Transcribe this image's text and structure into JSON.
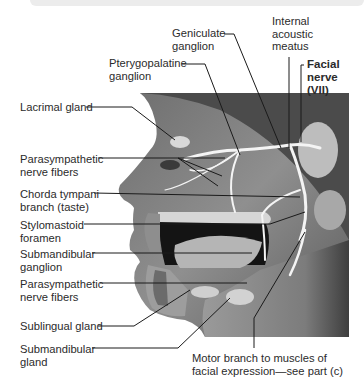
{
  "figure": {
    "title_label": "Facial\nnerve\n(VII)",
    "labels": {
      "geniculate": "Geniculate\nganglion",
      "internal_acoustic": "Internal\nacoustic\nmeatus",
      "pterygopalatine": "Pterygopalatine\nganglion",
      "lacrimal": "Lacrimal gland",
      "parasym_upper": "Parasympathetic\nnerve fibers",
      "chorda": "Chorda tympani\nbranch (taste)",
      "stylomastoid": "Stylomastoid\nforamen",
      "submandibular_ganglion": "Submandibular\nganglion",
      "parasym_lower": "Parasympathetic\nnerve fibers",
      "sublingual": "Sublingual gland",
      "submandibular_gland": "Submandibular\ngland",
      "motor_branch": "Motor branch to muscles of\nfacial expression—see part (c)"
    },
    "colors": {
      "background": "#ffffff",
      "leader_line": "#1a1a1a",
      "nerve": "#f2f2f2",
      "skin_mid": "#8a8a8a",
      "skin_dark": "#4a4a4a"
    }
  }
}
